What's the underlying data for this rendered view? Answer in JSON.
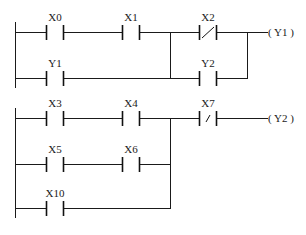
{
  "diagram": {
    "type": "plc-ladder-diagram",
    "networks": [
      {
        "id": 1,
        "coil": {
          "label": "( Y1 )",
          "output": "Y1"
        },
        "contacts": [
          {
            "label": "X0",
            "kind": "normally-open",
            "rung": 1
          },
          {
            "label": "X1",
            "kind": "normally-open",
            "rung": 1
          },
          {
            "label": "X2",
            "kind": "normally-closed",
            "rung": 1,
            "branch": "parallel-with-Y2"
          },
          {
            "label": "Y1",
            "kind": "normally-open",
            "rung": 2,
            "branch": "parallel-with-X0-X1"
          },
          {
            "label": "Y2",
            "kind": "normally-open",
            "rung": 2,
            "branch": "parallel-with-X2"
          }
        ]
      },
      {
        "id": 2,
        "coil": {
          "label": "( Y2 )",
          "output": "Y2"
        },
        "contacts": [
          {
            "label": "X3",
            "kind": "normally-open",
            "rung": 1
          },
          {
            "label": "X4",
            "kind": "normally-open",
            "rung": 1
          },
          {
            "label": "X5",
            "kind": "normally-open",
            "rung": 2
          },
          {
            "label": "X6",
            "kind": "normally-open",
            "rung": 2
          },
          {
            "label": "X10",
            "kind": "normally-open",
            "rung": 3
          },
          {
            "label": "X7",
            "kind": "normally-closed",
            "rung": 1
          }
        ]
      }
    ]
  },
  "labels": {
    "x0": "X0",
    "x1": "X1",
    "x2": "X2",
    "y1": "Y1",
    "y2": "Y2",
    "x3": "X3",
    "x4": "X4",
    "x5": "X5",
    "x6": "X6",
    "x10": "X10",
    "x7": "X7",
    "coil_y1": "( Y1 )",
    "coil_y2": "( Y2 )"
  },
  "colors": {
    "line": "#1a1a1a",
    "background": "#ffffff"
  }
}
